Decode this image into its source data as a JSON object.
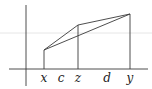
{
  "diagram": {
    "type": "convexity-illustration",
    "colors": {
      "ink": "#3a3a3a",
      "label": "#222222",
      "artifact": "#e6e6e6",
      "background": "#ffffff"
    },
    "axes": {
      "horizontal": {
        "x1": 9,
        "x2": 148,
        "y": 69
      },
      "vertical": {
        "x": 26,
        "y1": 5,
        "y2": 86
      }
    },
    "points": {
      "x": {
        "px": 44,
        "py": 50
      },
      "z": {
        "px": 78,
        "py": 25
      },
      "y": {
        "px": 130,
        "py": 14
      }
    },
    "labels": [
      {
        "id": "x",
        "text": "x",
        "px": 44
      },
      {
        "id": "c",
        "text": "c",
        "px": 61
      },
      {
        "id": "z",
        "text": "z",
        "px": 78
      },
      {
        "id": "d",
        "text": "d",
        "px": 107
      },
      {
        "id": "y",
        "text": "y",
        "px": 130
      }
    ],
    "label_baseline": 82
  }
}
